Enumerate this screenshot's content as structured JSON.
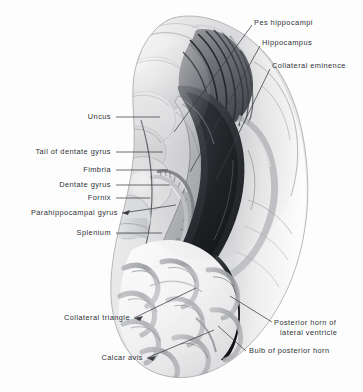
{
  "figure": {
    "view": "medial-superior dissection of temporal and occipital lobes",
    "background_color": "#fdfdfd",
    "ink_color": "#2e3136",
    "leader_color": "#3a3d42"
  },
  "labels": {
    "left": [
      {
        "id": "uncus",
        "text": "Uncus",
        "x": 111,
        "y": 117,
        "leader": "horizontal"
      },
      {
        "id": "tail-of-dentate-gyrus",
        "text": "Tail of dentate gyrus",
        "x": 111,
        "y": 152,
        "leader": "horizontal"
      },
      {
        "id": "fimbria",
        "text": "Fimbria",
        "x": 111,
        "y": 170,
        "leader": "horizontal"
      },
      {
        "id": "dentate-gyrus",
        "text": "Dentate gyrus",
        "x": 111,
        "y": 185,
        "leader": "horizontal"
      },
      {
        "id": "fornix",
        "text": "Fornix",
        "x": 111,
        "y": 198,
        "leader": "horizontal"
      },
      {
        "id": "parahippocampal-gyrus",
        "text": "Parahippocampal gyrus",
        "x": 118,
        "y": 213,
        "leader": "arrow"
      },
      {
        "id": "splenium",
        "text": "Splenium",
        "x": 111,
        "y": 233,
        "leader": "horizontal"
      },
      {
        "id": "collateral-triangle",
        "text": "Collateral triangle",
        "x": 130,
        "y": 318,
        "leader": "arrow"
      },
      {
        "id": "calcar-avis",
        "text": "Calcar avis",
        "x": 143,
        "y": 358,
        "leader": "arrow"
      }
    ],
    "right": [
      {
        "id": "pes-hippocampi",
        "text": "Pes hippocampi",
        "x": 254,
        "y": 23,
        "leader": "diagonal"
      },
      {
        "id": "hippocampus",
        "text": "Hippocampus",
        "x": 262,
        "y": 43,
        "leader": "diagonal"
      },
      {
        "id": "collateral-eminence",
        "text": "Collateral eminence",
        "x": 272,
        "y": 66,
        "leader": "diagonal"
      },
      {
        "id": "posterior-horn-of-lateral-ventricle",
        "text": "Posterior horn of",
        "text2": "lateral ventricle",
        "x": 274,
        "y": 322,
        "leader": "diagonal"
      },
      {
        "id": "bulb-of-posterior-horn",
        "text": "Bulb of posterior horn",
        "x": 249,
        "y": 351,
        "leader": "diagonal"
      }
    ]
  },
  "structures": [
    "Uncus",
    "Tail of dentate gyrus",
    "Fimbria",
    "Dentate gyrus",
    "Fornix",
    "Parahippocampal gyrus",
    "Splenium",
    "Collateral triangle",
    "Calcar avis",
    "Pes hippocampi",
    "Hippocampus",
    "Collateral eminence",
    "Posterior horn of lateral ventricle",
    "Bulb of posterior horn"
  ]
}
